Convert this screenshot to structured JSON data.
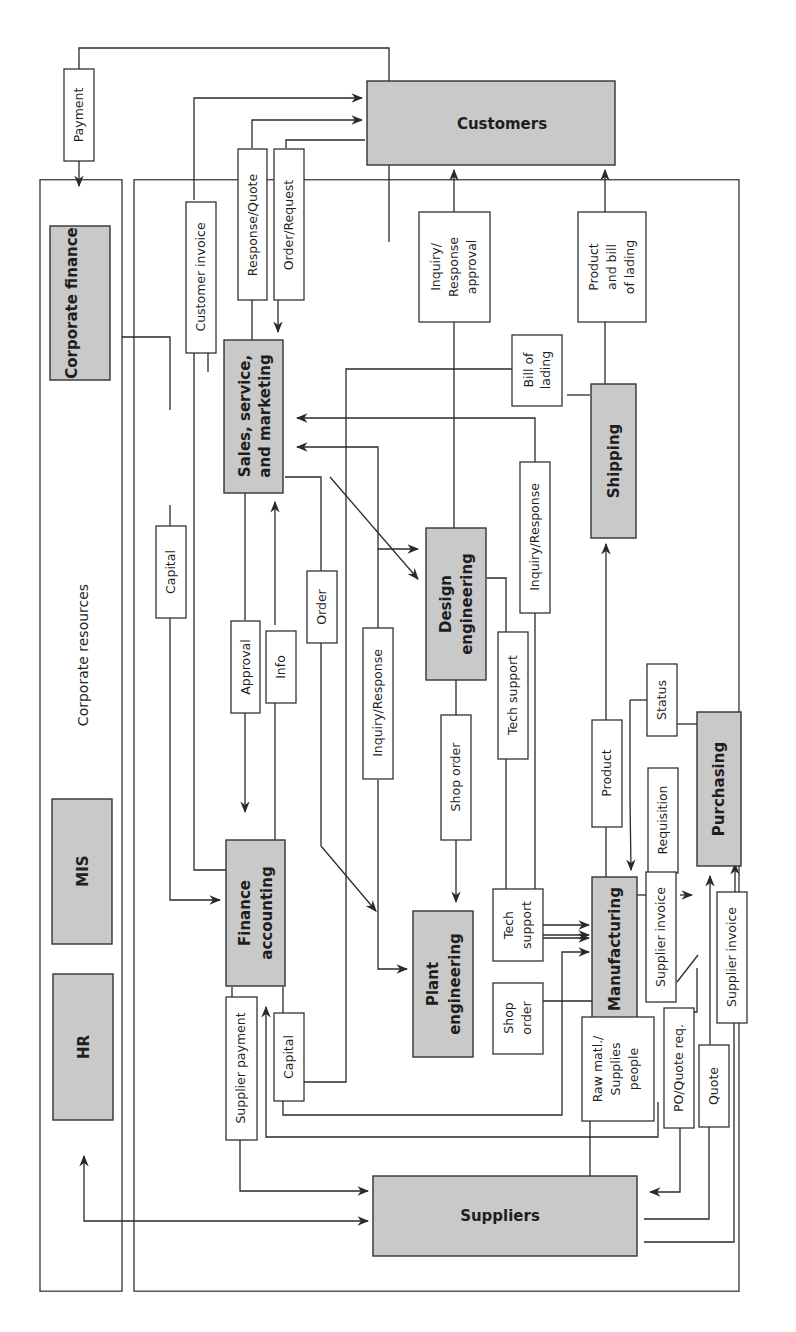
{
  "colors": {
    "node_fill": "#c9c9c9",
    "line": "#2a2a2a",
    "background": "#ffffff"
  },
  "corporate_resources": {
    "label": "Corporate resources",
    "units": [
      "Corporate finance",
      "MIS",
      "HR"
    ]
  },
  "nodes": {
    "customers": "Customers",
    "suppliers": "Suppliers",
    "sales": [
      "Sales, service,",
      "and marketing"
    ],
    "finance": [
      "Finance",
      "accounting"
    ],
    "design": [
      "Design",
      "engineering"
    ],
    "plant": [
      "Plant",
      "engineering"
    ],
    "manufacturing": "Manufacturing",
    "shipping": "Shipping",
    "purchasing": "Purchasing"
  },
  "flows": {
    "payment": "Payment",
    "customer_invoice": "Customer invoice",
    "response_quote": "Response/Quote",
    "order_request": "Order/Request",
    "inquiry_response_approval": [
      "Inquiry/",
      "Response",
      "approval"
    ],
    "product_bill_of_lading": [
      "Product",
      "and bill",
      "of lading"
    ],
    "bill_of_lading": [
      "Bill of",
      "lading"
    ],
    "capital_top": "Capital",
    "approval": "Approval",
    "info": "Info",
    "order": "Order",
    "inquiry_response_plant": "Inquiry/Response",
    "inquiry_response_mfg": "Inquiry/Response",
    "shop_order_design": "Shop order",
    "tech_support_design": "Tech support",
    "product": "Product",
    "status": "Status",
    "requisition": "Requisition",
    "supplier_invoice_mfg": "Supplier invoice",
    "tech_support_plant": [
      "Tech",
      "support"
    ],
    "shop_order_plant": [
      "Shop",
      "order"
    ],
    "supplier_payment": "Supplier payment",
    "capital_bottom": "Capital",
    "raw_materials": [
      "Raw matl./",
      "Supplies",
      "people"
    ],
    "po_quote_req": "PO/Quote req.",
    "quote": "Quote",
    "supplier_invoice_purch": "Supplier invoice"
  }
}
